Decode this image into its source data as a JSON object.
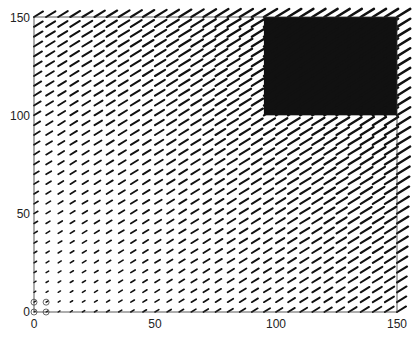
{
  "chart_data": {
    "type": "quiver",
    "title": "",
    "xlabel": "",
    "ylabel": "",
    "xlim": [
      0,
      150
    ],
    "ylim": [
      0,
      150
    ],
    "xticks": [
      0,
      50,
      100,
      150
    ],
    "yticks": [
      0,
      50,
      100,
      150
    ],
    "grid": false,
    "legend": null,
    "grid_spacing": 5,
    "field_description": "Vector field on a 5-unit grid; arrows point up-right (~30-35 deg), magnitude grows with x and y; dense dark saturated region for x>95 and y>100",
    "dark_region": {
      "x": [
        95,
        150
      ],
      "y": [
        100,
        150
      ]
    },
    "markers": [
      {
        "x": 0,
        "y": 0,
        "symbol": "circle"
      },
      {
        "x": 0,
        "y": 5,
        "symbol": "circle"
      },
      {
        "x": 5,
        "y": 0,
        "symbol": "circle"
      },
      {
        "x": 5,
        "y": 5,
        "symbol": "circle"
      }
    ]
  },
  "axes": {
    "x_tick_labels": [
      "0",
      "50",
      "100",
      "150"
    ],
    "y_tick_labels": [
      "0",
      "50",
      "100",
      "150"
    ]
  }
}
